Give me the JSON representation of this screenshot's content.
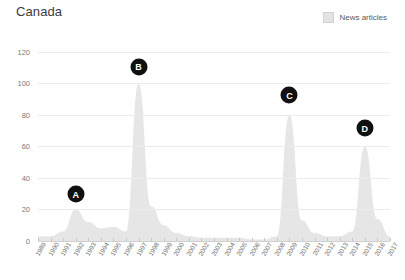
{
  "header": {
    "title": "Canada"
  },
  "legend": {
    "position": "top-right",
    "entries": [
      {
        "label": "News articles",
        "color": "#e3e3e3",
        "swatch_icon": "square-swatch"
      }
    ]
  },
  "axes": {
    "y_ticks": [
      0,
      20,
      40,
      60,
      80,
      100,
      120
    ],
    "x_ticks": [
      "1989",
      "1990",
      "1991",
      "1992",
      "1993",
      "1994",
      "1995",
      "1996",
      "1997",
      "1998",
      "1999",
      "2000",
      "2001",
      "2002",
      "2003",
      "2004",
      "2005",
      "2006",
      "2007",
      "2008",
      "2009",
      "2010",
      "2011",
      "2012",
      "2013",
      "2014",
      "2015",
      "2016",
      "2017"
    ]
  },
  "markers": [
    {
      "label": "A",
      "year": 1992,
      "value": 22
    },
    {
      "label": "B",
      "year": 1997,
      "value": 103
    },
    {
      "label": "C",
      "year": 2009,
      "value": 85
    },
    {
      "label": "D",
      "year": 2015,
      "value": 64
    }
  ],
  "chart_data": {
    "type": "area",
    "title": "Canada",
    "xlabel": "",
    "ylabel": "",
    "ylim": [
      0,
      125
    ],
    "grid": true,
    "legend_position": "top-right",
    "series": [
      {
        "name": "News articles",
        "color": "#e6e6e6",
        "x": [
          1989,
          1990,
          1991,
          1992,
          1993,
          1994,
          1995,
          1996,
          1997,
          1998,
          1999,
          2000,
          2001,
          2002,
          2003,
          2004,
          2005,
          2006,
          2007,
          2008,
          2009,
          2010,
          2011,
          2012,
          2013,
          2014,
          2015,
          2016,
          2017
        ],
        "values": [
          3,
          3,
          6,
          20,
          12,
          8,
          9,
          6,
          100,
          22,
          10,
          5,
          3,
          2,
          2,
          2,
          2,
          1,
          1,
          3,
          80,
          13,
          5,
          3,
          3,
          6,
          60,
          14,
          3
        ]
      }
    ],
    "annotations": [
      {
        "label": "A",
        "x": 1992,
        "y": 22
      },
      {
        "label": "B",
        "x": 1997,
        "y": 103
      },
      {
        "label": "C",
        "x": 2009,
        "y": 85
      },
      {
        "label": "D",
        "x": 2015,
        "y": 64
      }
    ]
  }
}
